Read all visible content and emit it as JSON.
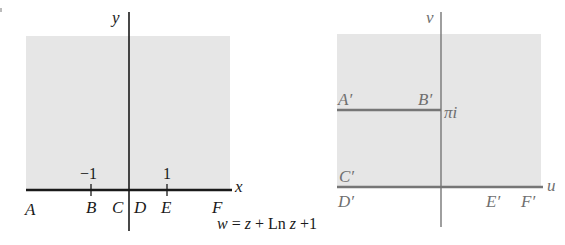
{
  "figure": {
    "mapping_formula": {
      "w": "w",
      "eq": " = ",
      "z1": "z",
      "plus1": " + Ln ",
      "z2": "z",
      "plus2": " +1"
    },
    "colors": {
      "shade": "#e6e6e6",
      "z_plane_lines": "#1a1a1a",
      "w_plane_lines": "#767676",
      "w_plane_labels": "#6f6f6f"
    }
  },
  "z_plane": {
    "axis_labels": {
      "x": "x",
      "y": "y"
    },
    "tick_labels": {
      "neg_one": "−1",
      "one": "1"
    },
    "points": {
      "A": "A",
      "B": "B",
      "C": "C",
      "D": "D",
      "E": "E",
      "F": "F"
    },
    "region": "upper half-plane (shaded), boundary along real axis"
  },
  "w_plane": {
    "axis_labels": {
      "u": "u",
      "v": "v"
    },
    "value_label": "πi",
    "points": {
      "A": "A′",
      "B": "B′",
      "C": "C′",
      "D": "D′",
      "E": "E′",
      "F": "F′"
    },
    "region": "image region (shaded) with slit along Im w = π for u ≤ 0"
  }
}
